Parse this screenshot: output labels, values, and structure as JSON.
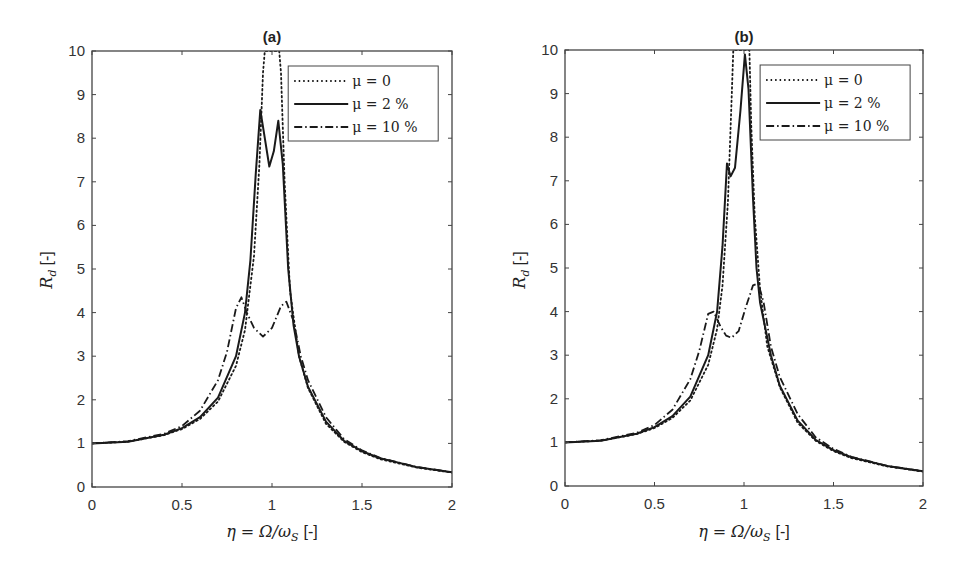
{
  "chart_data": [
    {
      "type": "line",
      "title": "(a)",
      "xlabel": "η = Ω/ω_S [-]",
      "ylabel": "R_d [-]",
      "xlim": [
        0,
        2
      ],
      "ylim": [
        0,
        10
      ],
      "xticks": [
        "0",
        "0.5",
        "1",
        "1.5",
        "2"
      ],
      "yticks": [
        "0",
        "1",
        "2",
        "3",
        "4",
        "5",
        "6",
        "7",
        "8",
        "9",
        "10"
      ],
      "grid": false,
      "legend_position": "upper right",
      "series": [
        {
          "name": "μ = 0",
          "style": "dotted",
          "x": [
            0,
            0.2,
            0.4,
            0.5,
            0.6,
            0.7,
            0.8,
            0.85,
            0.9,
            0.93,
            0.95,
            0.96,
            1.04,
            1.05,
            1.07,
            1.1,
            1.15,
            1.2,
            1.3,
            1.4,
            1.5,
            1.6,
            1.8,
            2.0
          ],
          "y": [
            1.0,
            1.04,
            1.19,
            1.33,
            1.56,
            1.96,
            2.78,
            3.6,
            5.3,
            7.4,
            9.5,
            10,
            10,
            9.5,
            7.0,
            4.5,
            3.0,
            2.27,
            1.45,
            1.04,
            0.8,
            0.64,
            0.45,
            0.33
          ]
        },
        {
          "name": "μ = 2 %",
          "style": "solid",
          "x": [
            0,
            0.2,
            0.4,
            0.5,
            0.6,
            0.7,
            0.8,
            0.85,
            0.88,
            0.91,
            0.935,
            0.96,
            0.985,
            1.01,
            1.035,
            1.06,
            1.09,
            1.12,
            1.15,
            1.2,
            1.3,
            1.4,
            1.5,
            1.6,
            1.8,
            2.0
          ],
          "y": [
            1.0,
            1.04,
            1.2,
            1.35,
            1.6,
            2.05,
            3.0,
            4.0,
            5.2,
            7.2,
            8.65,
            8.0,
            7.35,
            7.7,
            8.4,
            7.4,
            5.0,
            3.7,
            3.0,
            2.3,
            1.5,
            1.06,
            0.82,
            0.66,
            0.46,
            0.34
          ]
        },
        {
          "name": "μ = 10 %",
          "style": "dashdot",
          "x": [
            0,
            0.2,
            0.4,
            0.5,
            0.6,
            0.7,
            0.75,
            0.8,
            0.83,
            0.86,
            0.9,
            0.95,
            1.0,
            1.05,
            1.08,
            1.12,
            1.16,
            1.2,
            1.3,
            1.4,
            1.5,
            1.6,
            1.8,
            2.0
          ],
          "y": [
            1.0,
            1.05,
            1.22,
            1.4,
            1.75,
            2.45,
            3.1,
            4.1,
            4.35,
            4.0,
            3.65,
            3.45,
            3.65,
            4.15,
            4.25,
            3.8,
            3.0,
            2.45,
            1.6,
            1.1,
            0.84,
            0.67,
            0.46,
            0.34
          ]
        }
      ]
    },
    {
      "type": "line",
      "title": "(b)",
      "xlabel": "η = Ω/ω_S [-]",
      "ylabel": "R_d [-]",
      "xlim": [
        0,
        2
      ],
      "ylim": [
        0,
        10
      ],
      "xticks": [
        "0",
        "0.5",
        "1",
        "1.5",
        "2"
      ],
      "yticks": [
        "0",
        "1",
        "2",
        "3",
        "4",
        "5",
        "6",
        "7",
        "8",
        "9",
        "10"
      ],
      "grid": false,
      "legend_position": "upper right",
      "series": [
        {
          "name": "μ = 0",
          "style": "dotted",
          "x": [
            0,
            0.2,
            0.4,
            0.5,
            0.6,
            0.7,
            0.8,
            0.85,
            0.88,
            0.91,
            0.93,
            0.94,
            1.03,
            1.04,
            1.06,
            1.09,
            1.13,
            1.2,
            1.3,
            1.4,
            1.5,
            1.6,
            1.8,
            2.0
          ],
          "y": [
            1.0,
            1.04,
            1.19,
            1.33,
            1.56,
            1.96,
            2.78,
            3.6,
            4.6,
            6.5,
            8.8,
            10,
            10,
            8.3,
            6.2,
            4.5,
            3.2,
            2.27,
            1.45,
            1.04,
            0.8,
            0.64,
            0.45,
            0.33
          ]
        },
        {
          "name": "μ = 2 %",
          "style": "solid",
          "x": [
            0,
            0.2,
            0.4,
            0.5,
            0.6,
            0.7,
            0.8,
            0.85,
            0.88,
            0.905,
            0.925,
            0.95,
            0.98,
            1.005,
            1.025,
            1.05,
            1.07,
            1.09,
            1.12,
            1.15,
            1.2,
            1.3,
            1.4,
            1.5,
            1.6,
            1.8,
            2.0
          ],
          "y": [
            1.0,
            1.04,
            1.2,
            1.35,
            1.6,
            2.05,
            3.0,
            4.0,
            5.5,
            7.4,
            7.1,
            7.3,
            8.6,
            9.9,
            9.1,
            6.6,
            5.0,
            4.2,
            3.6,
            3.0,
            2.3,
            1.5,
            1.06,
            0.82,
            0.66,
            0.46,
            0.34
          ]
        },
        {
          "name": "μ = 10 %",
          "style": "dashdot",
          "x": [
            0,
            0.2,
            0.4,
            0.5,
            0.6,
            0.7,
            0.75,
            0.8,
            0.83,
            0.87,
            0.9,
            0.93,
            0.97,
            1.01,
            1.05,
            1.08,
            1.11,
            1.15,
            1.2,
            1.3,
            1.4,
            1.5,
            1.6,
            1.8,
            2.0
          ],
          "y": [
            1.0,
            1.05,
            1.22,
            1.4,
            1.75,
            2.45,
            3.1,
            3.95,
            4.0,
            3.65,
            3.45,
            3.4,
            3.55,
            4.1,
            4.6,
            4.65,
            4.2,
            3.2,
            2.5,
            1.65,
            1.12,
            0.85,
            0.67,
            0.46,
            0.34
          ]
        }
      ]
    }
  ],
  "panels": [
    {
      "title": "(a)",
      "ylabel_main": "R",
      "ylabel_sub": "d",
      "ylabel_unit": "[-]",
      "xlabel_eta": "η = Ω/ω",
      "xlabel_sub": "S",
      "xlabel_unit": "[-]"
    },
    {
      "title": "(b)",
      "ylabel_main": "R",
      "ylabel_sub": "d",
      "ylabel_unit": "[-]",
      "xlabel_eta": "η = Ω/ω",
      "xlabel_sub": "S",
      "xlabel_unit": "[-]"
    }
  ],
  "legend": [
    "μ = 0",
    "μ = 2 %",
    "μ = 10 %"
  ],
  "colors": {
    "line": "#1a1a1a",
    "axis": "#444444",
    "background": "#ffffff"
  }
}
